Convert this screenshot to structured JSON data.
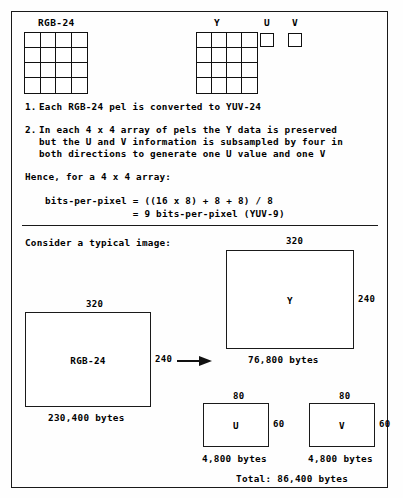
{
  "slide": {
    "top_diagram": {
      "rgb_label": "RGB-24",
      "y_label": "Y",
      "u_label": "U",
      "v_label": "V"
    },
    "steps": [
      {
        "number": "1.",
        "lines": [
          "Each RGB-24 pel is converted to YUV-24"
        ]
      },
      {
        "number": "2.",
        "lines": [
          "In each 4 x 4 array of pels the Y data is preserved",
          "but the U and V information is subsampled by four in",
          "both directions to generate one U value and one V"
        ]
      }
    ],
    "hence_line": "Hence, for a 4 x 4 array:",
    "formula": [
      "bits-per-pixel = ((16 x 8) + 8 + 8) / 8",
      "               = 9 bits-per-pixel (YUV-9)"
    ],
    "consider_heading": "Consider a typical image:",
    "boxes": {
      "rgb": {
        "name": "RGB-24",
        "width_label": "320",
        "height_label": "240",
        "bytes": "230,400 bytes"
      },
      "y": {
        "name": "Y",
        "width_label": "320",
        "height_label": "240",
        "bytes": "76,800 bytes"
      },
      "u": {
        "name": "U",
        "width_label": "80",
        "height_label": "60",
        "bytes": "4,800 bytes"
      },
      "v": {
        "name": "V",
        "width_label": "80",
        "height_label": "60",
        "bytes": "4,800 bytes"
      }
    },
    "total_line": "Total: 86,400 bytes"
  }
}
